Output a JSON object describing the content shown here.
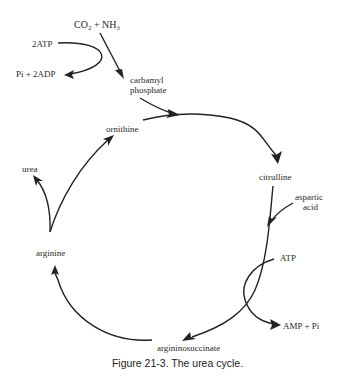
{
  "diagram": {
    "nodes": {
      "co2_nh3": "CO₂ + NH₃",
      "atp2": "2ATP",
      "pi_2adp": "Pi + 2ADP",
      "carbamyl_1": "carbamyl",
      "carbamyl_2": "phosphate",
      "ornithine": "ornithine",
      "citrulline": "citrulline",
      "aspartic_1": "aspartic",
      "aspartic_2": "acid",
      "atp": "ATP",
      "amp_pi": "AMP + Pi",
      "argininosuccinate": "argininosuccinate",
      "arginine": "arginine",
      "urea": "urea"
    },
    "edges": [
      {
        "from": "CO2 + NH3",
        "to": "carbamyl phosphate"
      },
      {
        "from": "2ATP",
        "to": "Pi + 2ADP"
      },
      {
        "from": "carbamyl phosphate",
        "to": "citrulline"
      },
      {
        "from": "ornithine",
        "to": "citrulline"
      },
      {
        "from": "citrulline",
        "to": "argininosuccinate"
      },
      {
        "from": "aspartic acid",
        "to": "argininosuccinate"
      },
      {
        "from": "ATP",
        "to": "AMP + Pi"
      },
      {
        "from": "argininosuccinate",
        "to": "arginine"
      },
      {
        "from": "arginine",
        "to": "urea"
      },
      {
        "from": "arginine",
        "to": "ornithine"
      }
    ],
    "caption": "Figure 21-3.  The urea cycle."
  }
}
